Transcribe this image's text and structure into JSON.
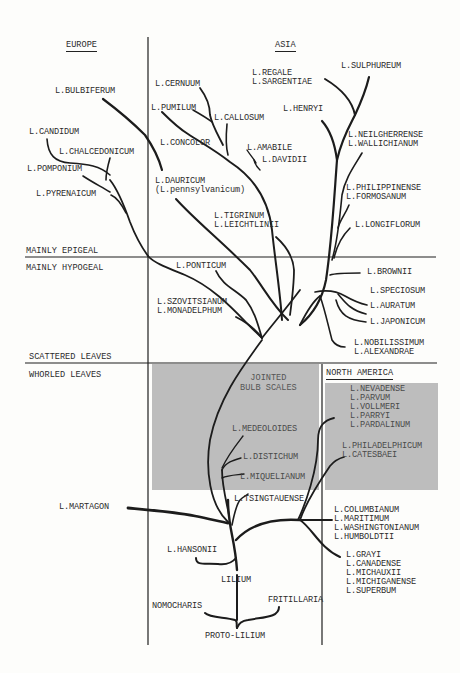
{
  "diagram": {
    "regions": {
      "europe": "EUROPE",
      "asia": "ASIA",
      "north_america": "NORTH AMERICA"
    },
    "axis_labels": {
      "mainly_epigeal": "MAINLY EPIGEAL",
      "mainly_hypogeal": "MAINLY HYPOGEAL",
      "scattered_leaves": "SCATTERED LEAVES",
      "whorled_leaves": "WHORLED LEAVES",
      "jointed_bulb_scales": "JOINTED\nBULB SCALES"
    },
    "colors": {
      "ink": "#1c1c1c",
      "shade": "#b9b9b9",
      "paper": "#fdfdfb"
    },
    "root": {
      "proto": "PROTO-LILIUM",
      "nomocharis": "NOMOCHARIS",
      "fritillaria": "FRITILLARIA",
      "lilium": "LILIUM"
    },
    "europe_species": {
      "bulbiferum": "L.BULBIFERUM",
      "candidum": "L.CANDIDUM",
      "chalcedonicum": "L.CHALCEDONICUM",
      "pomponium": "L.POMPONIUM",
      "pyrenaicum": "L.PYRENAICUM",
      "martagon": "L.MARTAGON"
    },
    "asia_species": {
      "cernuum": "L.CERNUUM",
      "pumilum": "L.PUMILUM",
      "callosum": "L.CALLOSUM",
      "concolor": "L.CONCOLOR",
      "amabile": "L.AMABILE",
      "davidii": "L.DAVIDII",
      "regale_sargentiae": "L.REGALE\nL.SARGENTIAE",
      "sulphureum": "L.SULPHUREUM",
      "henryi": "L.HENRYI",
      "neilgherrense_wallichianum": "L.NEILGHERRENSE\nL.WALLICHIANUM",
      "dauricum": "L.DAURICUM\n(L.pennsylvanicum)",
      "tigrinum_leichtlinii": "L.TIGRINUM\nL.LEICHTLINII",
      "philippinense_formosanum": "L.PHILIPPINENSE\nL.FORMOSANUM",
      "longiflorum": "L.LONGIFLORUM",
      "ponticum": "L.PONTICUM",
      "szovitsianum_monadelphum": "L.SZOVITSIANUM\nL.MONADELPHUM",
      "brownii": "L.BROWNII",
      "speciosum": "L.SPECIOSUM",
      "auratum": "L.AURATUM",
      "japonicum": "L.JAPONICUM",
      "nobilissimum_alexandrae": "L.NOBILISSIMUM\nL.ALEXANDRAE",
      "medeoloides": "L.MEDEOLOIDES",
      "distichum": "L.DISTICHUM",
      "miquelianum": "L.MIQUELIANUM",
      "tsingtauense": "L.TSINGTAUENSE",
      "hansonii": "L.HANSONII"
    },
    "north_america_species": {
      "west_group": "L.NEVADENSE\nL.PARVUM\nL.VOLLMERI\nL.PARRYI\nL.PARDALINUM",
      "philadelphicum_catesbaei": "L.PHILADELPHICUM\nL.CATESBAEI",
      "columbianum_group": "L.COLUMBIANUM\nL.MARITIMUM\nL.WASHINGTONIANUM\nL.HUMBOLDTII",
      "grayi_group": "L.GRAYI\nL.CANADENSE\nL.MICHAUXII\nL.MICHIGANENSE\nL.SUPERBUM"
    }
  }
}
